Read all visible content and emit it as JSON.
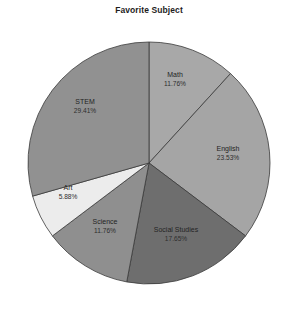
{
  "chart_data": {
    "type": "pie",
    "title": "Favorite Subject",
    "xlabel": "",
    "ylabel": "",
    "grid": false,
    "legend_position": "none",
    "labels_inside_slices": true,
    "start_angle_deg": 90,
    "direction": "clockwise",
    "categories": [
      "Math",
      "English",
      "Social Studies",
      "Science",
      "Art",
      "STEM"
    ],
    "values": [
      11.76,
      23.53,
      17.65,
      11.76,
      5.88,
      29.41
    ],
    "value_unit": "percent",
    "slices": [
      {
        "name": "Math",
        "percent": 11.76,
        "percent_label": "11.76%",
        "color": "#a8a8a8",
        "label_x": 175,
        "label_y": 77,
        "pct_x": 175,
        "pct_y": 86
      },
      {
        "name": "English",
        "percent": 23.53,
        "percent_label": "23.53%",
        "color": "#a5a5a5",
        "label_x": 228,
        "label_y": 151,
        "pct_x": 228,
        "pct_y": 160
      },
      {
        "name": "Social Studies",
        "percent": 17.65,
        "percent_label": "17.65%",
        "color": "#6e6e6e",
        "label_x": 176,
        "label_y": 232,
        "pct_x": 176,
        "pct_y": 241
      },
      {
        "name": "Science",
        "percent": 11.76,
        "percent_label": "11.76%",
        "color": "#8f8f8f",
        "label_x": 105,
        "label_y": 224,
        "pct_x": 105,
        "pct_y": 233
      },
      {
        "name": "Art",
        "percent": 5.88,
        "percent_label": "5.88%",
        "color": "#ececec",
        "label_x": 68,
        "label_y": 190,
        "pct_x": 68,
        "pct_y": 199
      },
      {
        "name": "STEM",
        "percent": 29.41,
        "percent_label": "29.41%",
        "color": "#919191",
        "label_x": 85,
        "label_y": 104,
        "pct_x": 85,
        "pct_y": 113
      }
    ],
    "geometry": {
      "center_x": 149,
      "center_y": 163,
      "radius": 121
    },
    "style": {
      "background": "#ffffff",
      "edge_color": "#3a3a3a",
      "edge_width": 0.8,
      "title_color": "#1d1d1d",
      "label_color": "#242424"
    }
  }
}
